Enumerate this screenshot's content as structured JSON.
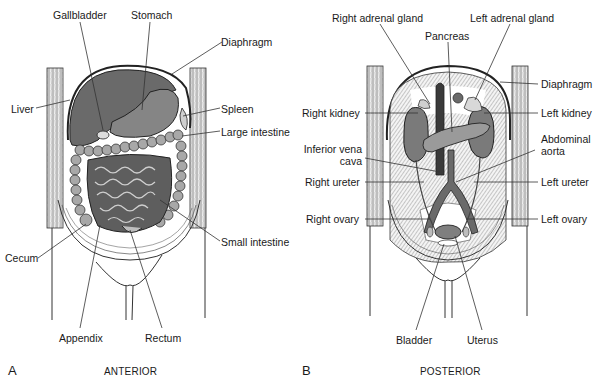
{
  "figure": {
    "panels": [
      {
        "letter": "A",
        "view": "ANTERIOR",
        "labels": {
          "gallbladder": "Gallbladder",
          "stomach": "Stomach",
          "diaphragm": "Diaphragm",
          "liver": "Liver",
          "spleen": "Spleen",
          "large_intestine": "Large intestine",
          "cecum": "Cecum",
          "small_intestine": "Small intestine",
          "appendix": "Appendix",
          "rectum": "Rectum"
        }
      },
      {
        "letter": "B",
        "view": "POSTERIOR",
        "labels": {
          "right_adrenal_gland": "Right adrenal gland",
          "left_adrenal_gland": "Left adrenal gland",
          "pancreas": "Pancreas",
          "diaphragm": "Diaphragm",
          "right_kidney": "Right kidney",
          "left_kidney": "Left kidney",
          "inferior_vena_cava_line1": "Inferior vena",
          "inferior_vena_cava_line2": "cava",
          "abdominal_aorta_line1": "Abdominal",
          "abdominal_aorta_line2": "aorta",
          "right_ureter": "Right ureter",
          "left_ureter": "Left ureter",
          "right_ovary": "Right ovary",
          "left_ovary": "Left ovary",
          "bladder": "Bladder",
          "uterus": "Uterus"
        }
      }
    ],
    "colors": {
      "organ_dark": "#5a5a5a",
      "organ_mid": "#7a7a7a",
      "organ_light": "#9a9a9a",
      "outline": "#222222",
      "leader_line": "#333333",
      "background": "#ffffff"
    }
  }
}
